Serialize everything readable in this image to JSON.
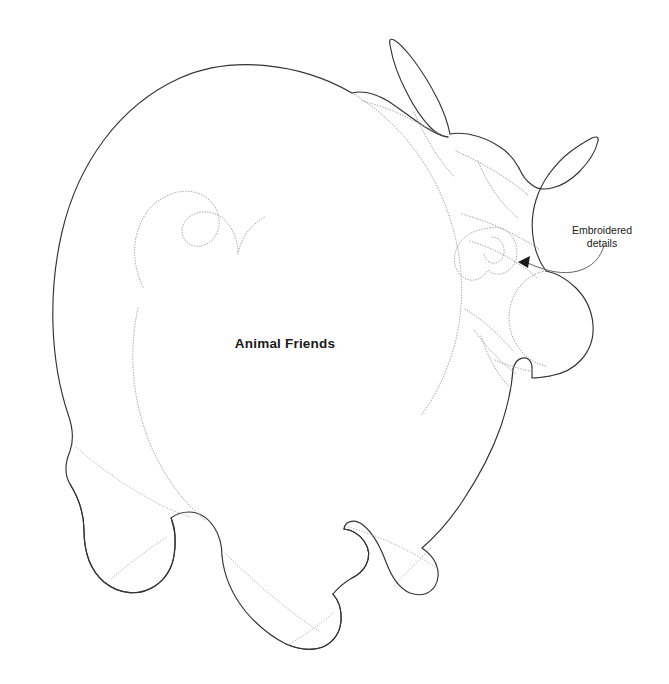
{
  "page": {
    "background_color": "#ffffff",
    "width": 669,
    "height": 684
  },
  "diagram": {
    "kind": "sewing-pattern-line-drawing",
    "outline_color": "#333333",
    "seam_color": "#9a9a9a",
    "text_color": "#1a1a1a"
  },
  "labels": {
    "center_title": "Animal Friends",
    "callout_line_1": "Embroidered",
    "callout_line_2": "details"
  }
}
